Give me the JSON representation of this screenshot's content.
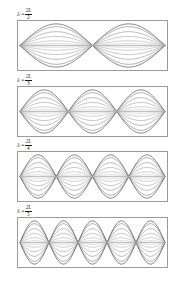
{
  "figure": {
    "background_color": "#ffffff",
    "frame_color": "#9b9b9b",
    "axis_color": "#8a8a8a",
    "text_color": "#1a1a1a",
    "panel_count": 4
  },
  "chart_data": {
    "type": "line",
    "xlabel": "",
    "ylabel": "",
    "xlim": [
      0,
      1
    ],
    "ylim": [
      -1,
      1
    ],
    "grid": false,
    "legend": "none",
    "snapshot_amplitudes": [
      1.0,
      0.87,
      0.64,
      0.42,
      0.22,
      0.08,
      0.0
    ],
    "snapshot_colors": [
      "#4a4a4a",
      "#666666",
      "#7d7d7d",
      "#919191",
      "#a5a5a5",
      "#b8b8b8",
      "#8a8a8a"
    ],
    "panels": [
      {
        "index": 1,
        "harmonic": 2,
        "antinodes": 2,
        "nodes": 3,
        "node_positions": [
          0,
          0.5,
          1
        ],
        "label": {
          "symbol": "λ",
          "equals": "=",
          "numerator": "2L",
          "denominator": "2",
          "full": "λ = 2L/2"
        }
      },
      {
        "index": 2,
        "harmonic": 3,
        "antinodes": 3,
        "nodes": 4,
        "node_positions": [
          0,
          0.3333,
          0.6667,
          1
        ],
        "label": {
          "symbol": "λ",
          "equals": "=",
          "numerator": "2L",
          "denominator": "3",
          "full": "λ = 2L/3"
        }
      },
      {
        "index": 3,
        "harmonic": 4,
        "antinodes": 4,
        "nodes": 5,
        "node_positions": [
          0,
          0.25,
          0.5,
          0.75,
          1
        ],
        "label": {
          "symbol": "λ",
          "equals": "=",
          "numerator": "2L",
          "denominator": "4",
          "full": "λ = 2L/4"
        }
      },
      {
        "index": 4,
        "harmonic": 5,
        "antinodes": 5,
        "nodes": 6,
        "node_positions": [
          0,
          0.2,
          0.4,
          0.6,
          0.8,
          1
        ],
        "label": {
          "symbol": "λ",
          "equals": "=",
          "numerator": "2L",
          "denominator": "5",
          "full": "λ = 2L/5"
        }
      }
    ]
  },
  "layout": {
    "panel_tops": [
      9,
      75,
      140,
      206
    ],
    "frame_left": 17,
    "frame_width": 151,
    "frame_height": 51
  }
}
